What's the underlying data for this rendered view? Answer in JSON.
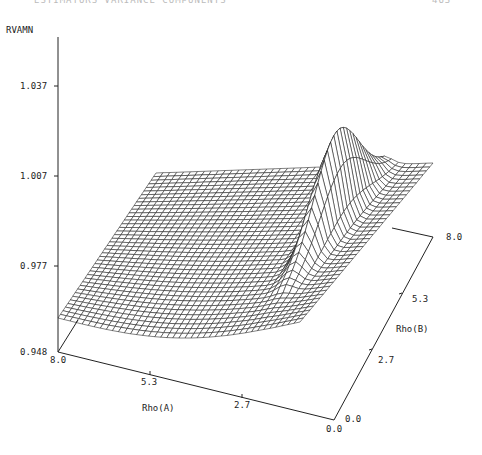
{
  "page_header": {
    "left": "ESTIMATORS VARIANCE COMPONENTS",
    "right": "463"
  },
  "chart_data": {
    "type": "surface3d",
    "title": "",
    "zlabel": "RVAMN",
    "xlabel": "Rho(A)",
    "ylabel": "Rho(B)",
    "z_ticks": [
      "1.037",
      "1.007",
      "0.977",
      "0.948"
    ],
    "x_ticks": [
      "8.0",
      "5.3",
      "2.7",
      "0.0"
    ],
    "y_ticks": [
      "0.0",
      "2.7",
      "5.3",
      "8.0"
    ],
    "zlim": [
      0.948,
      1.05
    ],
    "xlim": [
      0.0,
      8.0
    ],
    "ylim": [
      0.0,
      8.0
    ],
    "grid": false,
    "corner_values": [
      {
        "rhoA": 8.0,
        "rhoB": 0.0,
        "z": 0.96
      },
      {
        "rhoA": 0.0,
        "rhoB": 0.0,
        "z": 0.955
      },
      {
        "rhoA": 0.0,
        "rhoB": 8.0,
        "z": 1.005
      },
      {
        "rhoA": 8.0,
        "rhoB": 8.0,
        "z": 1.005
      }
    ],
    "peak": {
      "rhoA": 0.5,
      "rhoB": 5.0,
      "z": 1.02
    }
  }
}
